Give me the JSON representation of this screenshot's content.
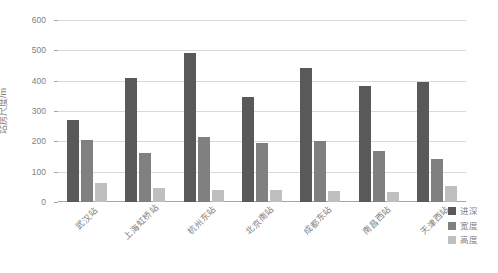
{
  "chart_data": {
    "type": "bar",
    "title": "",
    "xlabel": "",
    "ylabel": "站房尺度/m",
    "ylim": [
      0,
      600
    ],
    "ytick_values": [
      0,
      100,
      200,
      300,
      400,
      500,
      600
    ],
    "ytick_labels": [
      "0",
      "100",
      "200",
      "300",
      "400",
      "500",
      "600"
    ],
    "grid": true,
    "legend_position": "right",
    "categories": [
      "武汉站",
      "上海虹桥站",
      "杭州东站",
      "北京南站",
      "成都东站",
      "南昌西站",
      "天津西站"
    ],
    "series": [
      {
        "name": "进深",
        "color": "#595959",
        "values": [
          270,
          410,
          492,
          347,
          441,
          383,
          397
        ]
      },
      {
        "name": "宽度",
        "color": "#808080",
        "values": [
          203,
          163,
          215,
          196,
          202,
          167,
          142
        ]
      },
      {
        "name": "高度",
        "color": "#bfbfbf",
        "values": [
          62,
          46,
          40,
          38,
          37,
          32,
          53
        ]
      }
    ]
  },
  "axis": {
    "y_label_text": "站房尺度/m"
  },
  "legend": {
    "items": [
      {
        "label": "进深",
        "color": "#595959",
        "swatch_name": "legend-swatch-jinshen"
      },
      {
        "label": "宽度",
        "color": "#808080",
        "swatch_name": "legend-swatch-kuandu"
      },
      {
        "label": "高度",
        "color": "#bfbfbf",
        "swatch_name": "legend-swatch-gaodu"
      }
    ]
  },
  "colors": {
    "gridline": "#d9d9d9",
    "axis": "#a6a6a6",
    "tick_text": "#7f7f7f",
    "background": "#ffffff"
  }
}
